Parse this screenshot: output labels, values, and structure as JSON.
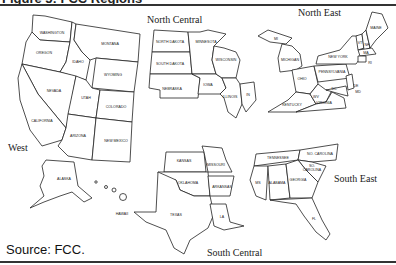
{
  "figure": {
    "title": "Figure 5: FCC Regions",
    "source": "Source:  FCC."
  },
  "regions": [
    {
      "name": "West",
      "states": [
        "WASHINGTON",
        "OREGON",
        "IDAHO",
        "MONTANA",
        "WYOMING",
        "NEVADA",
        "UTAH",
        "COLORADO",
        "CALIFORNIA",
        "ARIZONA",
        "NEW MEXICO",
        "ALASKA",
        "HAWAII"
      ]
    },
    {
      "name": "North Central",
      "states": [
        "NORTH DAKOTA",
        "MINNESOTA",
        "SOUTH DAKOTA",
        "WISCONSIN",
        "NEBRASKA",
        "IOWA",
        "ILLINOIS",
        "IN"
      ]
    },
    {
      "name": "North East",
      "states": [
        "MAINE",
        "VT",
        "NH",
        "MA",
        "RI",
        "CT",
        "NEW YORK",
        "MICHIGAN",
        "OHIO",
        "PENNSYLVANIA",
        "NJ",
        "DE",
        "MD",
        "DC",
        "WV",
        "VIRGINIA",
        "KENTUCKY"
      ]
    },
    {
      "name": "South Central",
      "states": [
        "KANSAS",
        "MISSOURI",
        "OKLAHOMA",
        "ARKANSAS",
        "TEXAS",
        "LA"
      ]
    },
    {
      "name": "South East",
      "states": [
        "TENNESSEE",
        "NO. CAROLINA",
        "SO. CAROLINA",
        "MS",
        "ALABAMA",
        "GEORGIA",
        "FL"
      ]
    }
  ]
}
